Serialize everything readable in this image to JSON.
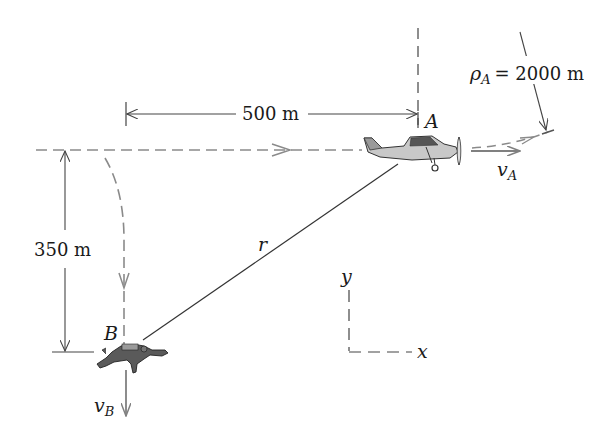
{
  "figure": {
    "type": "kinematics-diagram",
    "labels": {
      "point_a": "A",
      "point_b": "B",
      "position_vector": "r",
      "velocity_a": "v",
      "velocity_a_sub": "A",
      "velocity_b": "v",
      "velocity_b_sub": "B",
      "radius_symbol": "ρ",
      "radius_sub": "A",
      "radius_value": "= 2000 m",
      "axis_x": "x",
      "axis_y": "y"
    },
    "dimensions": {
      "horizontal": "500 m",
      "vertical": "350 m"
    },
    "colors": {
      "ink": "#1a1a1a",
      "path_gray": "#8a8a8a",
      "plane_fill": "#c8c8c8",
      "skydiver_fill": "#5a5a5a"
    }
  }
}
